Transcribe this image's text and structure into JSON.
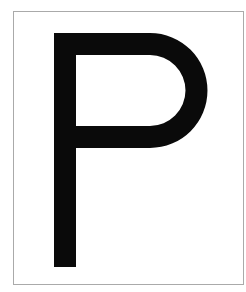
{
  "card": {
    "letter": "P",
    "border_color": "#aaaaaa",
    "glyph_color": "#0a0a0a",
    "background": "#ffffff"
  }
}
